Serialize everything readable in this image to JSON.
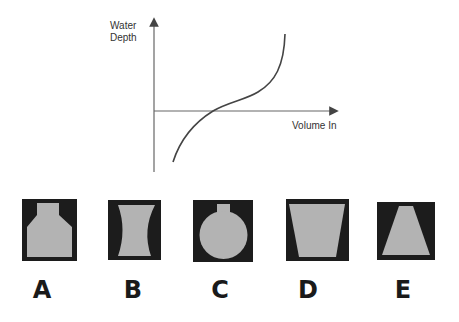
{
  "graph": {
    "y_axis_label_line1": "Water",
    "y_axis_label_line2": "Depth",
    "x_axis_label": "Volume In",
    "curve_description": "S-shaped curve: rises steeply, flattens in middle, then rises steeply again"
  },
  "options": [
    {
      "letter": "A",
      "shape": "bottle: narrow neck on top, sloped shoulders, wide straight body"
    },
    {
      "letter": "B",
      "shape": "hourglass: wide top and bottom, concave curved sides"
    },
    {
      "letter": "C",
      "shape": "round flask: narrow neck on top, spherical body"
    },
    {
      "letter": "D",
      "shape": "bucket: wide top tapering to narrower bottom"
    },
    {
      "letter": "E",
      "shape": "cone: narrow top widening to wide bottom"
    }
  ],
  "colors": {
    "vessel_background": "#1c1c1c",
    "vessel_fill": "#b3b3b3",
    "axis": "#555555",
    "curve": "#444444"
  }
}
